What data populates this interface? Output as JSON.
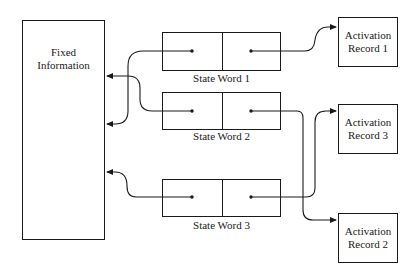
{
  "diagram": {
    "fixed_info": {
      "line1": "Fixed",
      "line2": "Information"
    },
    "state_words": [
      {
        "label": "State Word 1"
      },
      {
        "label": "State Word 2"
      },
      {
        "label": "State Word 3"
      }
    ],
    "activation_records": [
      {
        "line1": "Activation",
        "line2": "Record 1"
      },
      {
        "line1": "Activation",
        "line2": "Record 3"
      },
      {
        "line1": "Activation",
        "line2": "Record 2"
      }
    ],
    "connections": [
      {
        "from": "State Word 1 left cell",
        "to": "Fixed Information"
      },
      {
        "from": "State Word 2 left cell",
        "to": "Fixed Information"
      },
      {
        "from": "State Word 3 left cell",
        "to": "Fixed Information"
      },
      {
        "from": "State Word 1 right cell",
        "to": "Activation Record 1"
      },
      {
        "from": "State Word 2 right cell",
        "to": "Activation Record 2"
      },
      {
        "from": "State Word 3 right cell",
        "to": "Activation Record 3"
      }
    ],
    "colors": {
      "line": "#1a1a1a",
      "background": "#ffffff"
    }
  }
}
